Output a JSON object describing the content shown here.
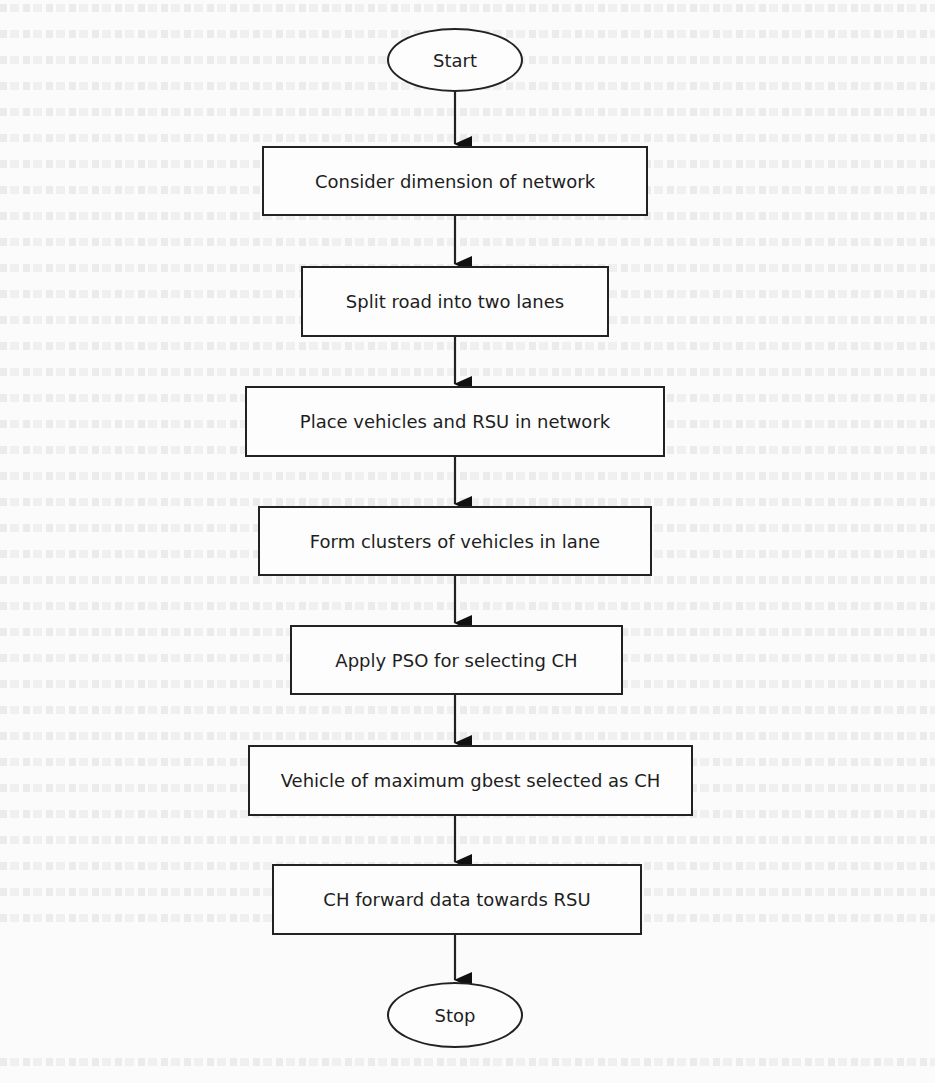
{
  "flowchart": {
    "start": {
      "label": "Start",
      "shape": "ellipse"
    },
    "steps": [
      {
        "label": "Consider dimension of network",
        "shape": "rectangle"
      },
      {
        "label": "Split road into two lanes",
        "shape": "rectangle"
      },
      {
        "label": "Place vehicles and RSU in network",
        "shape": "rectangle"
      },
      {
        "label": "Form clusters of vehicles in lane",
        "shape": "rectangle"
      },
      {
        "label": "Apply PSO for selecting CH",
        "shape": "rectangle"
      },
      {
        "label": "Vehicle of maximum gbest selected as CH",
        "shape": "rectangle"
      },
      {
        "label": "CH forward data towards RSU",
        "shape": "rectangle"
      }
    ],
    "stop": {
      "label": "Stop",
      "shape": "ellipse"
    },
    "direction": "top-to-bottom",
    "connector": "arrow",
    "colors": {
      "stroke": "#222222",
      "text": "#1e1e1e",
      "background": "#fbfbfb",
      "faded_page_text": "#e6e6e6"
    }
  }
}
